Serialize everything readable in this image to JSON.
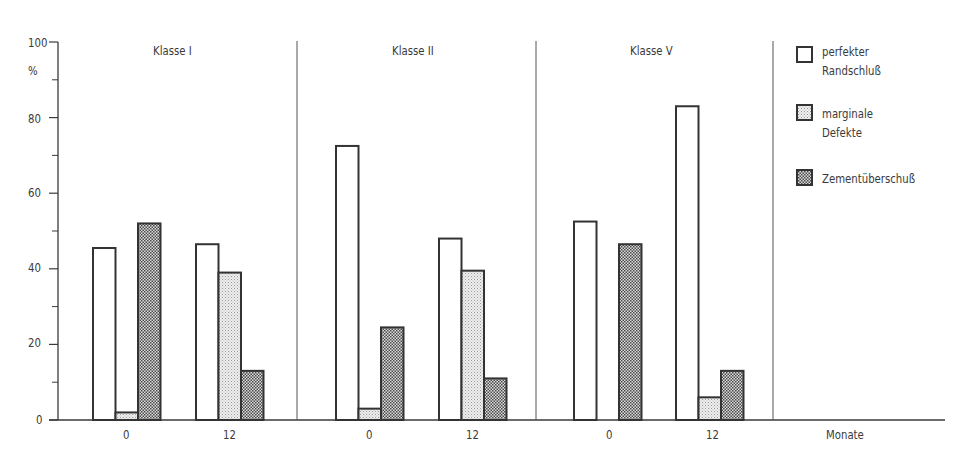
{
  "chart_data": {
    "type": "bar",
    "title": "",
    "xlabel": "Monate",
    "ylabel": "%",
    "ylim": [
      0,
      100
    ],
    "yticks": [
      0,
      20,
      40,
      60,
      80,
      100
    ],
    "yminor_ticks": [
      10,
      30,
      50,
      70,
      90
    ],
    "grid": false,
    "legend_position": "right",
    "groups": [
      {
        "name": "Klasse I",
        "categories": [
          "0",
          "12"
        ],
        "series": [
          {
            "name": "perfekter Randschluß",
            "values": [
              45.5,
              46.5
            ]
          },
          {
            "name": "marginale Defekte",
            "values": [
              2,
              39
            ]
          },
          {
            "name": "Zementüberschuß",
            "values": [
              52,
              13
            ]
          }
        ]
      },
      {
        "name": "Klasse II",
        "categories": [
          "0",
          "12"
        ],
        "series": [
          {
            "name": "perfekter Randschluß",
            "values": [
              72.5,
              48
            ]
          },
          {
            "name": "marginale Defekte",
            "values": [
              3,
              39.5
            ]
          },
          {
            "name": "Zementüberschuß",
            "values": [
              24.5,
              11
            ]
          }
        ]
      },
      {
        "name": "Klasse V",
        "categories": [
          "0",
          "12"
        ],
        "series": [
          {
            "name": "perfekter Randschluß",
            "values": [
              52.5,
              83
            ]
          },
          {
            "name": "marginale Defekte",
            "values": [
              0,
              6
            ]
          },
          {
            "name": "Zementüberschuß",
            "values": [
              46.5,
              13
            ]
          }
        ]
      }
    ],
    "legend": [
      {
        "label_lines": [
          "perfekter",
          "Randschluß"
        ],
        "pattern": "white"
      },
      {
        "label_lines": [
          "marginale",
          "Defekte"
        ],
        "pattern": "light-dots"
      },
      {
        "label_lines": [
          "Zementüberschuß"
        ],
        "pattern": "dark-dots"
      }
    ]
  },
  "axis": {
    "y_unit": "%",
    "y_labels": [
      "0",
      "20",
      "40",
      "60",
      "80",
      "100"
    ],
    "x_title": "Monate"
  },
  "panels": [
    {
      "title": "Klasse I",
      "x_labels": [
        "0",
        "12"
      ]
    },
    {
      "title": "Klasse II",
      "x_labels": [
        "0",
        "12"
      ]
    },
    {
      "title": "Klasse V",
      "x_labels": [
        "0",
        "12"
      ]
    }
  ],
  "legend": {
    "items": [
      {
        "line1": "perfekter",
        "line2": "Randschluß"
      },
      {
        "line1": "marginale",
        "line2": "Defekte"
      },
      {
        "line1": "Zementüberschuß",
        "line2": ""
      }
    ]
  },
  "colors": {
    "ink": "#3a3a3a",
    "bar_outline": "#333333",
    "light_fill_bg": "#ececec",
    "light_fill_dot": "#9a9a9a",
    "dark_fill_bg": "#d8d8d8",
    "dark_fill_dot": "#4a4a4a"
  }
}
